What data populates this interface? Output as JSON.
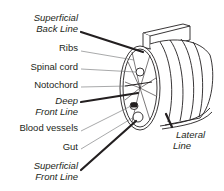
{
  "diagram": {
    "labels": {
      "superficial_back_line": [
        "Superficial",
        "Back Line"
      ],
      "ribs": "Ribs",
      "spinal_cord": "Spinal cord",
      "notochord": "Notochord",
      "deep_front_line": [
        "Deep",
        "Front Line"
      ],
      "blood_vessels": "Blood vessels",
      "gut": "Gut",
      "superficial_front_line": [
        "Superficial",
        "Front Line"
      ],
      "lateral_line": [
        "Lateral",
        "Line"
      ]
    },
    "colors": {
      "ink": "#231f20",
      "thin_leader": "#6d6e71",
      "background": "#ffffff"
    }
  }
}
